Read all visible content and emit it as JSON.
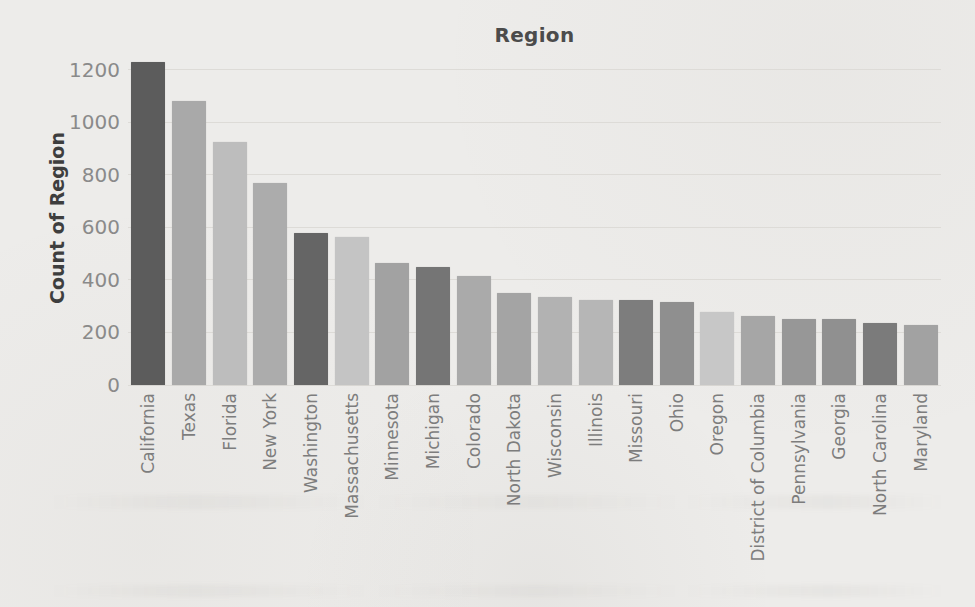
{
  "page": {
    "background_color": "#edecea",
    "text_color": "#4b4b4b"
  },
  "chart_data": {
    "type": "bar",
    "title": "Region",
    "xlabel": "",
    "ylabel": "Count of Region",
    "categories": [
      "California",
      "Texas",
      "Florida",
      "New York",
      "Washington",
      "Massachusetts",
      "Minnesota",
      "Michigan",
      "Colorado",
      "North Dakota",
      "Wisconsin",
      "Illinois",
      "Missouri",
      "Ohio",
      "Oregon",
      "District of Columbia",
      "Pennsylvania",
      "Georgia",
      "North Carolina",
      "Maryland"
    ],
    "values": [
      1230,
      1080,
      925,
      770,
      580,
      565,
      465,
      450,
      415,
      350,
      335,
      325,
      325,
      315,
      278,
      262,
      250,
      250,
      238,
      230
    ],
    "bar_colors": [
      "#5c5c5c",
      "#a9a9a9",
      "#bdbdbd",
      "#acacac",
      "#656565",
      "#c4c4c4",
      "#a2a2a2",
      "#757575",
      "#aaaaaa",
      "#a4a4a4",
      "#b2b2b2",
      "#b6b6b6",
      "#7d7d7d",
      "#8f8f8f",
      "#c7c7c7",
      "#a6a6a6",
      "#979797",
      "#909090",
      "#7b7b7b",
      "#a2a2a2"
    ],
    "y_ticks": [
      0,
      200,
      400,
      600,
      800,
      1000,
      1200
    ],
    "ylim": [
      0,
      1257
    ],
    "grid": "horizontal",
    "gridline_color": "#dddbd7",
    "legend": "none",
    "bar_orientation": "vertical",
    "x_tick_rotation_degrees": 90,
    "sort_order": "descending by value"
  }
}
